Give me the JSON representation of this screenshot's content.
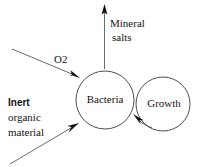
{
  "diagram": {
    "background_color": "#ffffff",
    "line_color": "#4a4a4a",
    "text_color": "#141414",
    "nodes": [
      {
        "id": "bacteria",
        "label": "Bacteria",
        "shape": "circle",
        "cx": 105,
        "cy": 100,
        "r": 29
      },
      {
        "id": "growth",
        "label": "Growth",
        "shape": "circle",
        "cx": 163,
        "cy": 104,
        "r": 27
      }
    ],
    "flows": [
      {
        "id": "mineral-salts",
        "label_line1": "Mineral",
        "label_line2": "salts",
        "direction": "out-up",
        "label_x": 110,
        "label_y1": 24,
        "label_y2": 38
      },
      {
        "id": "oxygen",
        "label": "O2",
        "direction": "in-from-upper-left",
        "label_x": 55,
        "label_y": 60
      },
      {
        "id": "inert-organic-material",
        "label_line1": "Inert",
        "label_line2": "organic",
        "label_line3": "material",
        "direction": "in-from-lower-left",
        "label_x": 8,
        "label_y1": 103,
        "label_y2": 118,
        "label_y3": 133
      },
      {
        "id": "growth-feedback",
        "label": "",
        "direction": "growth-to-bacteria"
      }
    ]
  }
}
